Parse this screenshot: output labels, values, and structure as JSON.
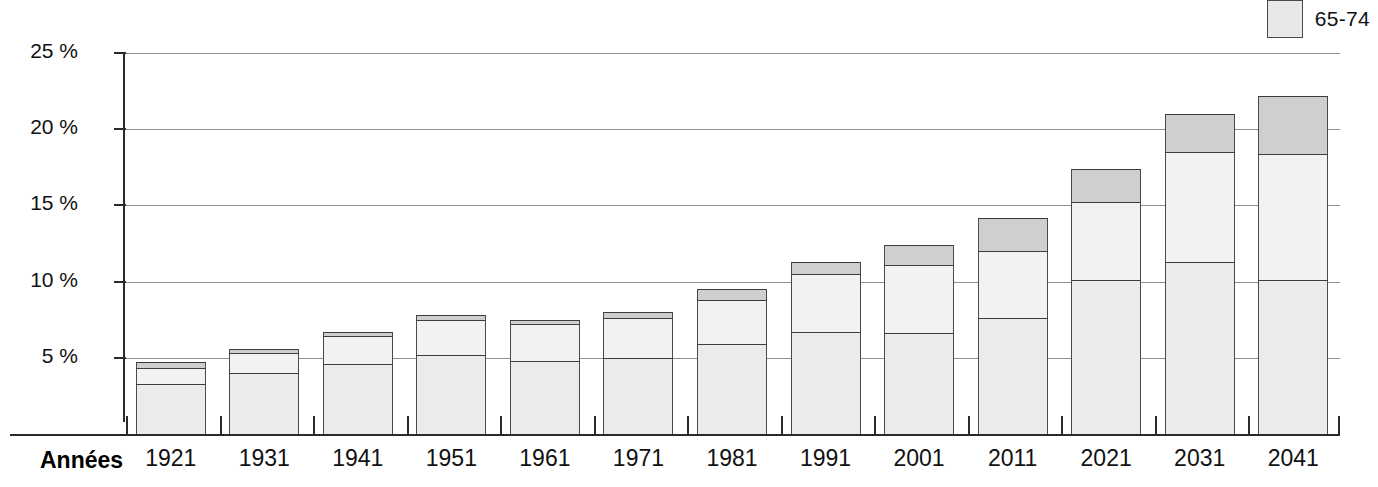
{
  "legend": {
    "items": [
      {
        "label": "65-74",
        "color": "#e8e8e8",
        "name": "legend-item-65-74"
      }
    ]
  },
  "axis": {
    "x_title": "Années",
    "y_ticks": [
      "5 %",
      "10 %",
      "15 %",
      "20 %",
      "25 %"
    ],
    "y_tick_values": [
      5,
      10,
      15,
      20,
      25
    ]
  },
  "chart_data": {
    "type": "bar",
    "subtype": "stacked",
    "title": "",
    "xlabel": "Années",
    "ylabel": "",
    "ylim": [
      0,
      25
    ],
    "grid": true,
    "legend_position": "top-right",
    "categories": [
      "1921",
      "1931",
      "1941",
      "1951",
      "1961",
      "1971",
      "1981",
      "1991",
      "2001",
      "2011",
      "2021",
      "2031",
      "2041"
    ],
    "series": [
      {
        "name": "65-74",
        "color": "#ebebeb",
        "values": [
          3.3,
          4.0,
          4.6,
          5.2,
          4.8,
          5.0,
          5.9,
          6.7,
          6.6,
          7.6,
          10.1,
          11.3,
          10.1
        ]
      },
      {
        "name": "75-84",
        "color": "#f2f2f2",
        "values": [
          1.0,
          1.3,
          1.8,
          2.3,
          2.4,
          2.6,
          2.9,
          3.8,
          4.5,
          4.4,
          5.1,
          7.2,
          8.3
        ]
      },
      {
        "name": "85+",
        "color": "#cfcfcf",
        "values": [
          0.4,
          0.3,
          0.3,
          0.3,
          0.3,
          0.4,
          0.7,
          0.8,
          1.3,
          2.2,
          2.2,
          2.5,
          3.8
        ]
      }
    ],
    "totals": [
      4.7,
      5.6,
      6.7,
      7.8,
      7.5,
      8.0,
      9.5,
      11.3,
      12.4,
      14.2,
      17.4,
      21.0,
      22.2
    ]
  }
}
